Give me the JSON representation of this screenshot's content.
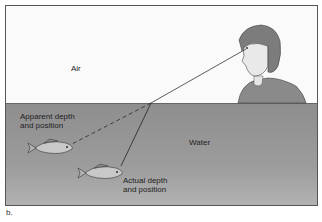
{
  "labels": {
    "air": "Air",
    "water": "Water",
    "apparent_line1": "Apparent depth",
    "apparent_line2": "and position",
    "actual_line1": "Actual depth",
    "actual_line2": "and position"
  },
  "caption": "b.",
  "colors": {
    "air": "#fafafa",
    "water": "#999999",
    "line": "#333333"
  }
}
